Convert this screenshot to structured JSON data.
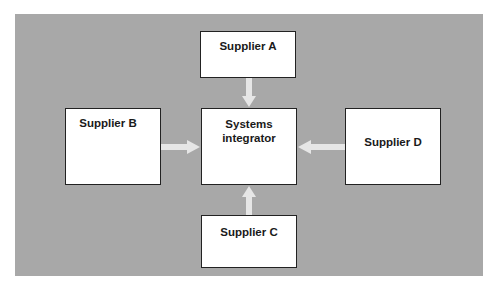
{
  "diagram": {
    "background_color": "#a8a8a8",
    "arrow_color": "#e6e6e6",
    "nodes": {
      "supplier_a": {
        "label": "Supplier A"
      },
      "supplier_b": {
        "label": "Supplier B"
      },
      "supplier_c": {
        "label": "Supplier C"
      },
      "supplier_d": {
        "label": "Supplier D"
      },
      "integrator": {
        "line1": "Systems",
        "line2": "integrator"
      }
    },
    "edges": [
      {
        "from": "Supplier A",
        "to": "Systems integrator"
      },
      {
        "from": "Supplier B",
        "to": "Systems integrator"
      },
      {
        "from": "Supplier C",
        "to": "Systems integrator"
      },
      {
        "from": "Supplier D",
        "to": "Systems integrator"
      }
    ]
  }
}
